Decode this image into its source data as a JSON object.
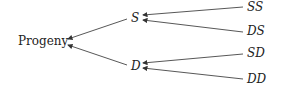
{
  "diagram": {
    "root": "Progeny",
    "level1": [
      {
        "label": "S",
        "children": [
          "SS",
          "DS"
        ]
      },
      {
        "label": "D",
        "children": [
          "SD",
          "DD"
        ]
      }
    ],
    "edges": [
      {
        "from": "S",
        "to": "Progeny"
      },
      {
        "from": "D",
        "to": "Progeny"
      },
      {
        "from": "SS",
        "to": "S"
      },
      {
        "from": "DS",
        "to": "S"
      },
      {
        "from": "SD",
        "to": "D"
      },
      {
        "from": "DD",
        "to": "D"
      }
    ]
  }
}
